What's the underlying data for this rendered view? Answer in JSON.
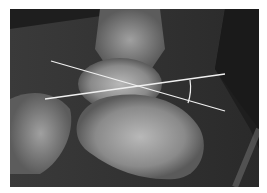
{
  "image": {
    "type": "lateral ankle radiograph",
    "background_color": "#1e1e1e",
    "bone_color": "#a8a8a8"
  },
  "overlay": {
    "line_color": "#f0f0f0",
    "lines": [
      {
        "name": "line-a",
        "x1": 41,
        "y1": 52,
        "x2": 215,
        "y2": 102
      },
      {
        "name": "line-b",
        "x1": 35,
        "y1": 90,
        "x2": 215,
        "y2": 65
      }
    ],
    "angle_arc": {
      "cx": 133,
      "cy": 78,
      "r": 48
    }
  }
}
